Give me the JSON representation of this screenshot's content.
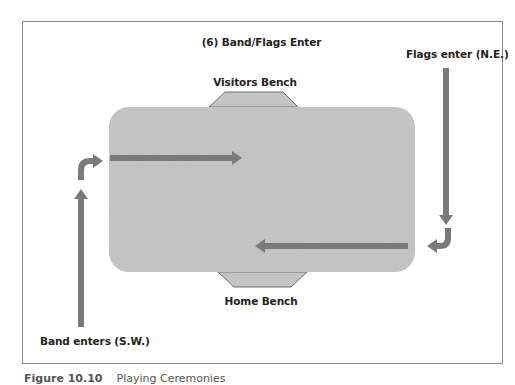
{
  "diagram": {
    "title": "(6) Band/Flags Enter",
    "labels": {
      "visitors_bench": "Visitors Bench",
      "home_bench": "Home Bench",
      "flags_enter": "Flags enter (N.E.)",
      "band_enters": "Band enters (S.W.)"
    },
    "colors": {
      "field_fill": "#c8c8c8",
      "bench_fill": "#c4c4c4",
      "bench_stroke": "#6e6e6e",
      "arrow_fill": "#7a7a7a",
      "frame_stroke": "#8a8a8a",
      "text": "#222222"
    },
    "elements": {
      "field": {
        "shape": "rounded-rectangle",
        "x": 109,
        "y": 107,
        "width": 306,
        "height": 165,
        "corner_radius": 20
      },
      "visitors_bench": {
        "shape": "trapezoid",
        "position": "top-center of field"
      },
      "home_bench": {
        "shape": "trapezoid",
        "position": "bottom-center of field"
      },
      "arrows": [
        {
          "id": "band-up-arrow",
          "direction": "up",
          "from": "bottom-left outside field",
          "to": "left side"
        },
        {
          "id": "band-hook-arrow",
          "direction": "up-then-right",
          "entering": "field from left"
        },
        {
          "id": "band-right-arrow",
          "direction": "right",
          "location": "upper field"
        },
        {
          "id": "flags-down-arrow",
          "direction": "down",
          "from": "top-right outside field"
        },
        {
          "id": "flags-hook-arrow",
          "direction": "down-then-left",
          "entering": "field from right"
        },
        {
          "id": "flags-left-arrow",
          "direction": "left",
          "location": "lower field"
        }
      ]
    }
  },
  "caption": {
    "figure_number": "Figure 10.10",
    "text": "Playing Ceremonies"
  }
}
